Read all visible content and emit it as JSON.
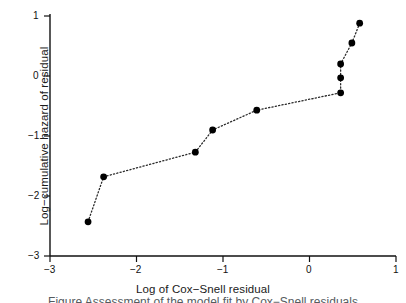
{
  "chart_data": {
    "type": "scatter",
    "title": "",
    "xlabel": "Log of Cox−Snell residual",
    "ylabel": "Log−cumulative hazard of residual",
    "xlim": [
      -3,
      1
    ],
    "ylim": [
      -3,
      1
    ],
    "xticks": [
      -3,
      -2,
      -1,
      0,
      1
    ],
    "yticks": [
      -3,
      -2,
      -1,
      0,
      1
    ],
    "xticklabels": [
      "−3",
      "−2",
      "−1",
      "0",
      "1"
    ],
    "yticklabels": [
      "−3",
      "−2",
      "−1",
      "0",
      "1"
    ],
    "grid": false,
    "legend": false,
    "marker": "filled-circle",
    "marker_color": "#000000",
    "line_style": "dotted",
    "line_color": "#2b2b2b",
    "series": [
      {
        "name": "Log-cumulative hazard vs Cox-Snell residual",
        "x": [
          -2.56,
          -2.38,
          -1.32,
          -1.12,
          -0.61,
          0.36,
          0.36,
          0.36,
          0.49,
          0.58
        ],
        "y": [
          -2.43,
          -1.68,
          -1.27,
          -0.9,
          -0.57,
          -0.28,
          -0.03,
          0.2,
          0.55,
          0.88
        ]
      }
    ]
  },
  "figure": {
    "x_axis_title": "Log of Cox−Snell residual",
    "y_axis_title": "Log−cumulative hazard of residual",
    "caption": "Figure  Assessment of the model fit by Cox−Snell residuals"
  }
}
